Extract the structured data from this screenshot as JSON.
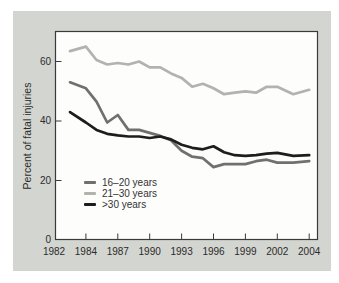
{
  "figure": {
    "page_background": "#ffffff",
    "card_background": "#d3d5d0",
    "plot_background": "#fdfdfc",
    "frame_color": "#3a3a3a",
    "text_color": "#2b2b2b"
  },
  "chart_data": {
    "type": "line",
    "title": "",
    "xlabel": "",
    "ylabel": "Percent of fatal injuries",
    "ylim": [
      0,
      70
    ],
    "grid": false,
    "legend_position": "inside-lower-left",
    "x_tick_labels": [
      "1982",
      "1984",
      "1987",
      "1990",
      "1993",
      "1996",
      "1999",
      "2002",
      "2004"
    ],
    "x_tick_years": [
      1982,
      1984,
      1987,
      1990,
      1993,
      1996,
      1999,
      2002,
      2004
    ],
    "y_ticks": [
      0,
      20,
      40,
      60
    ],
    "years": [
      1983,
      1984,
      1985,
      1986,
      1987,
      1988,
      1989,
      1990,
      1991,
      1992,
      1993,
      1994,
      1995,
      1996,
      1997,
      1998,
      1999,
      2000,
      2001,
      2002,
      2003,
      2004
    ],
    "series": [
      {
        "name": "16–20 years",
        "color": "#6f716f",
        "values": [
          53,
          51,
          46.5,
          39.5,
          42,
          37,
          37,
          36,
          35,
          33.5,
          30,
          28,
          27.5,
          24.5,
          25.5,
          25.5,
          25.5,
          26.5,
          27,
          26,
          26,
          26.5
        ]
      },
      {
        "name": "21–30 years",
        "color": "#b1b3af",
        "values": [
          63.5,
          65,
          60.5,
          59,
          59.5,
          59,
          60,
          58,
          58,
          56,
          54.5,
          51.5,
          52.5,
          51,
          49,
          49.5,
          50,
          49.5,
          51.5,
          51.5,
          49,
          50.5
        ]
      },
      {
        "name": ">30 years",
        "color": "#1d1d1d",
        "values": [
          43,
          39.5,
          37,
          35.7,
          35.2,
          34.8,
          34.8,
          34.3,
          34.8,
          33.8,
          32,
          31,
          30.5,
          31.5,
          29.5,
          28.5,
          28.3,
          28.5,
          29,
          29.3,
          28.3,
          28.5
        ]
      }
    ]
  }
}
